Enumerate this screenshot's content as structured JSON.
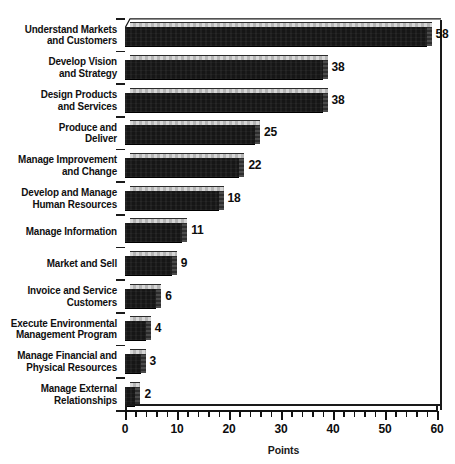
{
  "chart_data": {
    "type": "bar",
    "orientation": "horizontal",
    "title": "",
    "xlabel": "Points",
    "ylabel": "",
    "xlim": [
      0,
      60
    ],
    "x_major_step": 10,
    "x_minor_step": 2,
    "grid": false,
    "legend": null,
    "style_3d": true,
    "categories": [
      "Understand Markets and Customers",
      "Develop Vision and Strategy",
      "Design Products and Services",
      "Produce and Deliver",
      "Manage Improvement and Change",
      "Develop and Manage Human Resources",
      "Manage Information",
      "Market and Sell",
      "Invoice and Service Customers",
      "Execute Environmental Management Program",
      "Manage Financial and Physical Resources",
      "Manage External Relationships"
    ],
    "category_lines": [
      [
        "Understand Markets",
        "and Customers"
      ],
      [
        "Develop Vision",
        "and Strategy"
      ],
      [
        "Design Products",
        "and Services"
      ],
      [
        "Produce and",
        "Deliver"
      ],
      [
        "Manage Improvement",
        "and Change"
      ],
      [
        "Develop and Manage",
        "Human Resources"
      ],
      [
        "Manage Information"
      ],
      [
        "Market and Sell"
      ],
      [
        "Invoice and Service",
        "Customers"
      ],
      [
        "Execute Environmental",
        "Management Program"
      ],
      [
        "Manage Financial and",
        "Physical Resources"
      ],
      [
        "Manage External",
        "Relationships"
      ]
    ],
    "values": [
      58,
      38,
      38,
      25,
      22,
      18,
      11,
      9,
      6,
      4,
      3,
      2
    ],
    "value_labels": [
      "58",
      "38",
      "38",
      "25",
      "22",
      "18",
      "11",
      "9",
      "6",
      "4",
      "3",
      "2"
    ],
    "tick_labels": [
      "0",
      "10",
      "20",
      "30",
      "40",
      "50",
      "60"
    ],
    "tick_values": [
      0,
      10,
      20,
      30,
      40,
      50,
      60
    ],
    "colors": {
      "bar_front": "#161616",
      "bar_top": "#c9c9c9",
      "bar_side": "#3a3a3a",
      "axis": "#111111",
      "text": "#0d0d0d",
      "background": "#ffffff"
    }
  }
}
